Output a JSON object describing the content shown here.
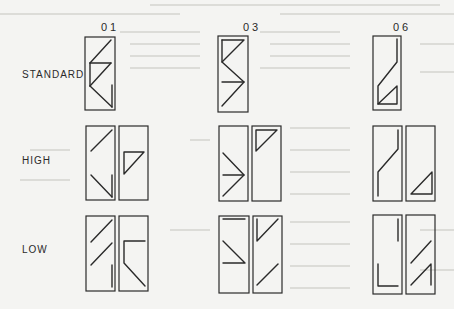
{
  "figure": {
    "columns": [
      {
        "id": "01",
        "label": "01"
      },
      {
        "id": "03",
        "label": "03"
      },
      {
        "id": "06",
        "label": "06"
      }
    ],
    "rows": [
      {
        "id": "standard",
        "label": "STANDARD"
      },
      {
        "id": "high",
        "label": "HIGH"
      },
      {
        "id": "low",
        "label": "LOW"
      }
    ],
    "colors": {
      "background": "#f4f4f2",
      "ink": "#2a2a2a",
      "bleed_through": "#d8d8d4"
    }
  }
}
